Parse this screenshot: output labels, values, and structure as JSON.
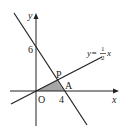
{
  "diagram": {
    "type": "coordinate-plane",
    "axes": {
      "x_label": "x",
      "y_label": "y",
      "origin_label": "O"
    },
    "ticks": {
      "y_intercept": "6",
      "x_intercept": "4"
    },
    "points": {
      "P": "P",
      "A": "A"
    },
    "lines": [
      {
        "name": "line-through-6-and-4",
        "equation": "y = -3/2 x + 6"
      },
      {
        "name": "line-half-x",
        "equation_prefix": "y=",
        "frac_num": "1",
        "frac_den": "2",
        "equation_suffix": "x"
      }
    ],
    "shaded_region": "triangle OPA",
    "colors": {
      "line": "#222222",
      "shade": "#a6a6a6",
      "background": "#ffffff"
    }
  }
}
